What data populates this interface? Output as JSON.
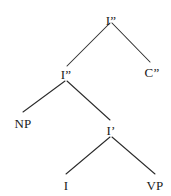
{
  "figure": {
    "kind": "syntax-tree",
    "background_color": "#ffffff",
    "line_color": "#2b2b2b",
    "text_color": "#1a1a1a"
  },
  "nodes": [
    {
      "id": "root-ibar2",
      "label": "I”",
      "x": 111,
      "y": 14
    },
    {
      "id": "ibar2",
      "label": "I”",
      "x": 66,
      "y": 68
    },
    {
      "id": "cbar2",
      "label": "C”",
      "x": 152,
      "y": 66
    },
    {
      "id": "np",
      "label": "NP",
      "x": 23,
      "y": 117
    },
    {
      "id": "ibar1",
      "label": "I’",
      "x": 111,
      "y": 124
    },
    {
      "id": "i",
      "label": "I",
      "x": 66,
      "y": 179
    },
    {
      "id": "vp",
      "label": "VP",
      "x": 155,
      "y": 179
    }
  ],
  "edges": [
    {
      "id": "root-to-ibar2",
      "from": "root-ibar2",
      "to": "ibar2",
      "x1": 110,
      "y1": 23,
      "x2": 67,
      "y2": 66
    },
    {
      "id": "root-to-cbar2",
      "from": "root-ibar2",
      "to": "cbar2",
      "x1": 112,
      "y1": 23,
      "x2": 150,
      "y2": 62
    },
    {
      "id": "ibar2-to-np",
      "from": "ibar2",
      "to": "np",
      "x1": 65,
      "y1": 81,
      "x2": 23,
      "y2": 112
    },
    {
      "id": "ibar2-to-ibar1",
      "from": "ibar2",
      "to": "ibar1",
      "x1": 67,
      "y1": 81,
      "x2": 110,
      "y2": 120
    },
    {
      "id": "ibar1-to-i",
      "from": "ibar1",
      "to": "i",
      "x1": 110,
      "y1": 137,
      "x2": 66,
      "y2": 174
    },
    {
      "id": "ibar1-to-vp",
      "from": "ibar1",
      "to": "vp",
      "x1": 112,
      "y1": 137,
      "x2": 155,
      "y2": 174
    }
  ]
}
